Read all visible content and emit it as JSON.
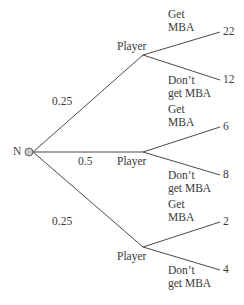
{
  "root": {
    "label": "N",
    "x": 29,
    "y": 152
  },
  "chance_edges": [
    {
      "prob": "0.25",
      "to": 0,
      "label_pos": [
        52,
        95
      ]
    },
    {
      "prob": "0.5",
      "to": 1,
      "label_pos": [
        78,
        155
      ]
    },
    {
      "prob": "0.25",
      "to": 2,
      "label_pos": [
        52,
        215
      ]
    }
  ],
  "players": [
    {
      "label": "Player",
      "x": 143,
      "y": 55,
      "label_pos": [
        117,
        40
      ]
    },
    {
      "label": "Player",
      "x": 143,
      "y": 152,
      "label_pos": [
        117,
        155
      ]
    },
    {
      "label": "Player",
      "x": 143,
      "y": 247,
      "label_pos": [
        117,
        250
      ]
    }
  ],
  "leaves": [
    {
      "player": 0,
      "action": "Get\nMBA",
      "payoff": "22",
      "y": 32,
      "action_pos": [
        168,
        8
      ]
    },
    {
      "player": 0,
      "action": "Don’t\nget MBA",
      "payoff": "12",
      "y": 80,
      "action_pos": [
        168,
        74
      ]
    },
    {
      "player": 1,
      "action": "Get\nMBA",
      "payoff": "6",
      "y": 127,
      "action_pos": [
        168,
        103
      ]
    },
    {
      "player": 1,
      "action": "Don’t\nget MBA",
      "payoff": "8",
      "y": 175,
      "action_pos": [
        168,
        169
      ]
    },
    {
      "player": 2,
      "action": "Get\nMBA",
      "payoff": "2",
      "y": 222,
      "action_pos": [
        168,
        198
      ]
    },
    {
      "player": 2,
      "action": "Don’t\nget MBA",
      "payoff": "4",
      "y": 270,
      "action_pos": [
        168,
        264
      ]
    }
  ],
  "leaf_x": 220,
  "colors": {
    "line": "#4a4a4a",
    "node_fill": "#c8c8c8",
    "text": "#3a3a3a"
  }
}
